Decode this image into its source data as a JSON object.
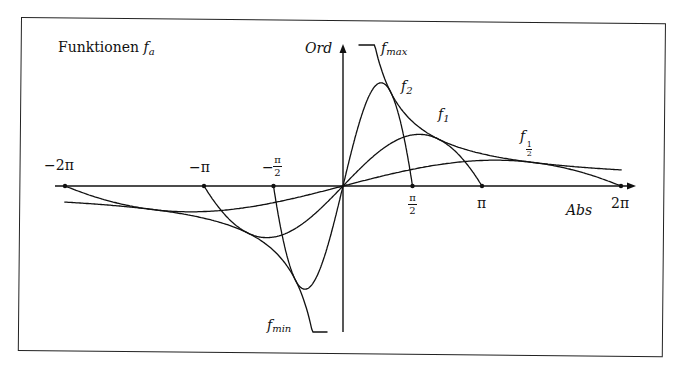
{
  "chart_data": {
    "type": "line",
    "xlabel": "Abs",
    "ylabel": "Ord",
    "x_ticks": [
      {
        "label": "-2π",
        "value": -6.2832
      },
      {
        "label": "-π",
        "value": -3.1416
      },
      {
        "label": "-π/2",
        "value": -1.5708
      },
      {
        "label": "π/2",
        "value": 1.5708
      },
      {
        "label": "π",
        "value": 3.1416
      },
      {
        "label": "2π",
        "value": 6.2832
      }
    ],
    "xlim": [
      -7.0,
      6.6
    ],
    "grid": false,
    "legend": "inline curve labels",
    "series": [
      {
        "name": "f_2",
        "a": 2,
        "zero_crossings": [
          -1.5708,
          0,
          1.5708
        ],
        "peak": {
          "x": 0.86,
          "y": 2.24
        }
      },
      {
        "name": "f_1",
        "a": 1,
        "zero_crossings": [
          -3.1416,
          0,
          3.1416
        ],
        "peak": {
          "x": 1.72,
          "y": 1.12
        }
      },
      {
        "name": "f_1/2",
        "a": 0.5,
        "zero_crossings": [
          -6.2832,
          0,
          6.2832
        ],
        "peak": {
          "x": 3.44,
          "y": 0.56
        }
      },
      {
        "name": "f_max",
        "kind": "envelope (upper)",
        "domain": [
          0.35,
          6.3
        ]
      },
      {
        "name": "f_min",
        "kind": "envelope (lower)",
        "domain": [
          -6.3,
          -0.35
        ]
      }
    ]
  },
  "labels": {
    "title_text": "Funktionen ",
    "title_f": "f",
    "title_sub": "a",
    "ord": "Ord",
    "abs": "Abs",
    "fmax_f": "f",
    "fmax_sub": "max",
    "fmin_f": "f",
    "fmin_sub": "min",
    "f2_f": "f",
    "f2_sub": "2",
    "f1_f": "f",
    "f1_sub": "1",
    "fhalf_f": "f",
    "fhalf_num": "1",
    "fhalf_den": "2",
    "tick_m2pi": "−2π",
    "tick_mpi": "−π",
    "tick_mhalfpi_sign": "−",
    "tick_pi_num": "π",
    "tick_2": "2",
    "tick_pi": "π",
    "tick_2pi": "2π"
  }
}
